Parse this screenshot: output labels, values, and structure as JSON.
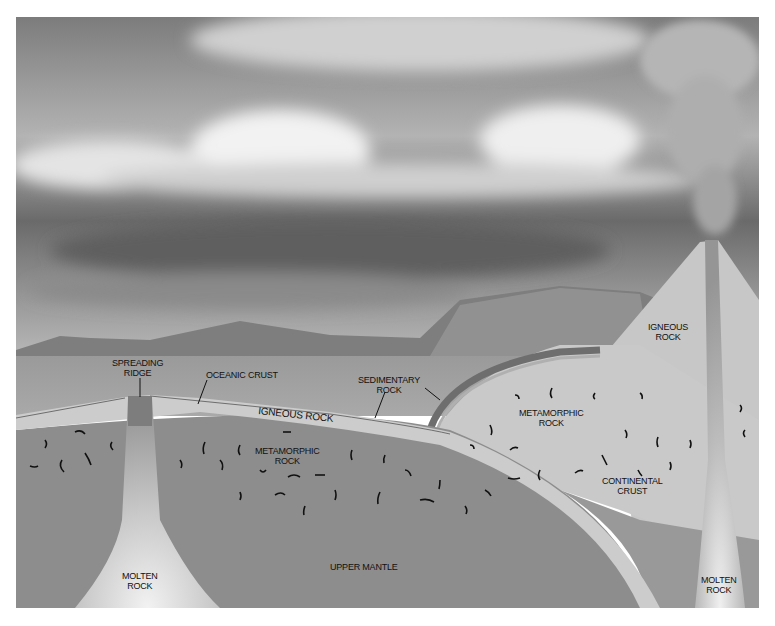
{
  "figure": {
    "kind": "geologic cross-section diagram",
    "labels": {
      "spreading_ridge": [
        "SPREADING",
        "RIDGE"
      ],
      "oceanic_crust": "OCEANIC CRUST",
      "igneous_rock_band": "IGNEOUS ROCK",
      "sedimentary_rock": [
        "SEDIMENTARY",
        "ROCK"
      ],
      "igneous_rock_volcano": [
        "IGNEOUS",
        "ROCK"
      ],
      "metamorphic_rock_continental": [
        "METAMORPHIC",
        "ROCK"
      ],
      "metamorphic_rock_oceanic": [
        "METAMORPHIC",
        "ROCK"
      ],
      "continental_crust": [
        "CONTINENTAL",
        "CRUST"
      ],
      "upper_mantle": "UPPER MANTLE",
      "molten_rock_left": [
        "MOLTEN",
        "ROCK"
      ],
      "molten_rock_right": [
        "MOLTEN",
        "ROCK"
      ]
    },
    "colors": {
      "sky": "#8a8a8a",
      "cloud": "#e6e6e6",
      "ocean": "#a6a6a6",
      "mantle": "#8c8c8c",
      "crust_band": "#c8c8c8",
      "continent": "#c9c9c9",
      "magma": "#d8d8d8",
      "mountain": "#7a7a7a"
    }
  }
}
